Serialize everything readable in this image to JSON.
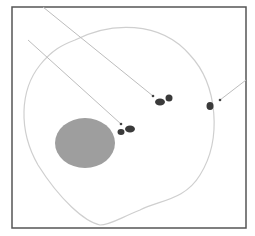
{
  "figure": {
    "caption_clipped": "",
    "frame": {
      "x": 12,
      "y": 7,
      "width": 234,
      "height": 221,
      "stroke": "#555555"
    },
    "cell_outline": {
      "stroke": "#cfcfcf",
      "path": "M 75 40 C 110 22, 160 20, 190 55 C 218 85, 222 140, 200 175 C 185 200, 160 200, 140 210 C 120 218, 110 225, 100 225 C 85 222, 60 200, 38 165 C 18 130, 20 90, 40 65 C 52 50, 62 45, 75 40 Z"
    },
    "nucleus": {
      "cx": 85,
      "cy": 143,
      "rx": 30,
      "ry": 25,
      "fill": "#9e9e9e"
    },
    "dots": [
      {
        "name": "upper-cluster-left",
        "cx": 160,
        "cy": 102,
        "rx": 5,
        "ry": 3.5,
        "fill": "#3a3a3a"
      },
      {
        "name": "upper-cluster-right",
        "cx": 169,
        "cy": 98,
        "rx": 3.5,
        "ry": 3.5,
        "fill": "#3a3a3a"
      },
      {
        "name": "lower-cluster-left",
        "cx": 121,
        "cy": 132,
        "rx": 3.5,
        "ry": 3,
        "fill": "#3a3a3a"
      },
      {
        "name": "lower-cluster-right",
        "cx": 130,
        "cy": 129,
        "rx": 5,
        "ry": 3.5,
        "fill": "#3a3a3a"
      },
      {
        "name": "right-dot",
        "cx": 210,
        "cy": 106,
        "rx": 3.5,
        "ry": 4,
        "fill": "#3a3a3a"
      }
    ],
    "arrows": [
      {
        "name": "arrow-to-upper-cluster",
        "x1": 43,
        "y1": 7,
        "x2": 153,
        "y2": 96,
        "stroke": "#bdbdbd"
      },
      {
        "name": "arrow-to-lower-cluster",
        "x1": 28,
        "y1": 40,
        "x2": 121,
        "y2": 124,
        "stroke": "#bdbdbd"
      },
      {
        "name": "arrow-to-right-dot",
        "x1": 246,
        "y1": 80,
        "x2": 220,
        "y2": 100,
        "stroke": "#bdbdbd"
      }
    ],
    "arrow_tips": [
      {
        "cx": 153,
        "cy": 96
      },
      {
        "cx": 121,
        "cy": 124
      },
      {
        "cx": 220,
        "cy": 100
      }
    ]
  }
}
